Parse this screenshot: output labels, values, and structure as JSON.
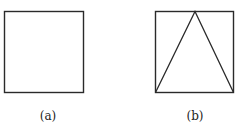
{
  "figures": [
    {
      "id": "a",
      "label": "(a)",
      "shape": "square"
    },
    {
      "id": "b",
      "label": "(b)",
      "shape": "square with inscribed isosceles triangle (apex at top-center, base on bottom edge)"
    }
  ],
  "colors": {
    "stroke": "#2a2a2a",
    "background": "#ffffff"
  }
}
